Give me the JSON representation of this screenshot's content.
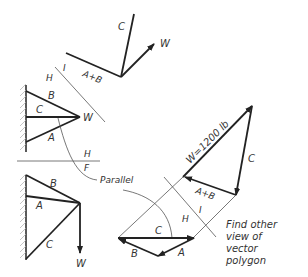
{
  "top_view": {
    "labels": {
      "c": "C",
      "w": "W",
      "ab": "A+B"
    }
  },
  "fold_line_hi": {
    "h": "H",
    "i": "I"
  },
  "front_view": {
    "labels": {
      "b": "B",
      "c": "C",
      "a": "A",
      "w": "W"
    }
  },
  "fold_line_hf": {
    "h": "H",
    "f": "F"
  },
  "side_view": {
    "labels": {
      "b": "B",
      "a": "A",
      "c": "C",
      "w": "W"
    }
  },
  "parallel_note": "Parallel",
  "vector_polygon": {
    "w_label": "W=1200 lb",
    "c_label": "C",
    "ab_label": "A+B",
    "fold_h": "H",
    "fold_i": "I"
  },
  "bottom_polygon": {
    "c": "C",
    "b": "B",
    "a": "A"
  },
  "note": {
    "line1": "Find other",
    "line2": "view of",
    "line3": "vector",
    "line4": "polygon"
  }
}
